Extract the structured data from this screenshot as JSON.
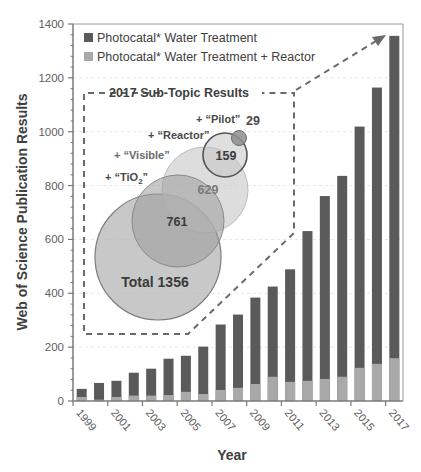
{
  "chart_data": {
    "type": "bar",
    "stacked": true,
    "title": "",
    "xlabel": "Year",
    "ylabel": "Web of Science  Publication Results",
    "ylim": [
      0,
      1400
    ],
    "yticks": [
      0,
      200,
      400,
      600,
      800,
      1000,
      1200,
      1400
    ],
    "categories": [
      "1999",
      "2000",
      "2001",
      "2002",
      "2003",
      "2004",
      "2005",
      "2006",
      "2007",
      "2008",
      "2009",
      "2010",
      "2011",
      "2012",
      "2013",
      "2014",
      "2015",
      "2016",
      "2017"
    ],
    "xtick_labels": [
      "1999",
      "2001",
      "2003",
      "2005",
      "2007",
      "2009",
      "2011",
      "2013",
      "2015",
      "2017"
    ],
    "series": [
      {
        "name": "Photocatal* Water Treatment",
        "color": "#5a5a5a",
        "values": [
          45,
          67,
          75,
          105,
          120,
          157,
          168,
          202,
          284,
          321,
          384,
          425,
          489,
          631,
          761,
          836,
          1019,
          1164,
          1356
        ]
      },
      {
        "name": "Photocatal* Water Treatment + Reactor",
        "color": "#a9a9a9",
        "values": [
          15,
          5,
          15,
          20,
          20,
          22,
          34,
          26,
          41,
          49,
          63,
          90,
          71,
          75,
          82,
          90,
          123,
          138,
          159
        ]
      }
    ],
    "legend": {
      "position": "upper-left",
      "entries": [
        "Photocatal* Water Treatment",
        "Photocatal* Water Treatment + Reactor"
      ]
    },
    "grid": true,
    "inset": {
      "title": "2017 Sub-Topic Results",
      "bubbles": [
        {
          "label": "Total",
          "value": 1356,
          "text": "Total 1356"
        },
        {
          "label": "+ “TiO₂”",
          "value": 761,
          "text": "761"
        },
        {
          "label": "+ “Visible”",
          "value": 629,
          "text": "629"
        },
        {
          "label": "+ “Reactor”",
          "value": 159,
          "text": "159"
        },
        {
          "label": "+ “Pilot”",
          "value": 29,
          "text": "29"
        }
      ]
    }
  },
  "labels": {
    "ylabel": "Web of Science  Publication Results",
    "xlabel": "Year",
    "legend1": "Photocatal* Water Treatment",
    "legend2": "Photocatal* Water Treatment + Reactor",
    "inset_title": "2017 Sub-Topic Results",
    "pilot_label": "+ “Pilot”",
    "pilot_value": "29",
    "reactor_label": "+ “Reactor”",
    "reactor_value": "159",
    "visible_label": "+ “Visible”",
    "visible_value": "629",
    "tio2_label_prefix": "+ “TiO",
    "tio2_label_sub": "2",
    "tio2_label_suffix": "”",
    "tio2_value": "761",
    "total_value": "Total 1356"
  },
  "colors": {
    "dark_bar": "#5a5a5a",
    "light_bar": "#a9a9a9",
    "axis": "#7a7a7a",
    "text": "#404040",
    "tick_text": "#606060",
    "grid": "#e6e6e6",
    "dash": "#6a6a6a"
  }
}
